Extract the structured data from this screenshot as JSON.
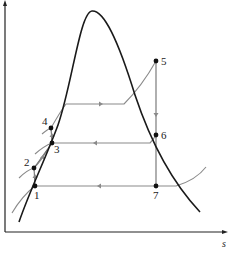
{
  "diagram": {
    "type": "T-s diagram (thermodynamic cycle with saturation dome)",
    "axes": {
      "x_label": "s",
      "y_label": "T"
    },
    "points": [
      {
        "id": "1",
        "label": "1"
      },
      {
        "id": "2",
        "label": "2"
      },
      {
        "id": "3",
        "label": "3"
      },
      {
        "id": "4",
        "label": "4"
      },
      {
        "id": "5",
        "label": "5"
      },
      {
        "id": "6",
        "label": "6"
      },
      {
        "id": "7",
        "label": "7"
      }
    ],
    "colors": {
      "dome": "#1a1a1a",
      "process_lines": "#6e6e6e",
      "isobars": "#8a8a8a",
      "axes": "#222222",
      "points": "#111111"
    }
  }
}
